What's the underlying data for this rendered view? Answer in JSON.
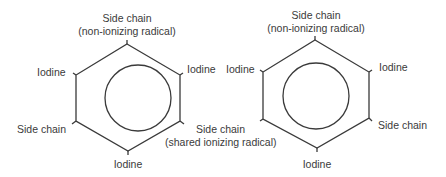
{
  "diagrams": [
    {
      "name": "structure-left",
      "labels": {
        "top_line1": "Side chain",
        "top_line2": "(non-ionizing radical)",
        "upper_left": "Iodine",
        "upper_right": "Iodine",
        "lower_left": "Side chain",
        "lower_right_line1": "Side chain",
        "lower_right_line2": "(shared ionizing radical)",
        "bottom": "Iodine"
      }
    },
    {
      "name": "structure-right",
      "labels": {
        "top_line1": "Side chain",
        "top_line2": "(non-ionizing radical)",
        "upper_left": "Iodine",
        "upper_right": "Iodine",
        "lower_right": "Side chain",
        "bottom": "Iodine"
      }
    }
  ],
  "colors": {
    "line": "#3a3a3a",
    "text": "#3a3a3a",
    "background": "#ffffff"
  }
}
